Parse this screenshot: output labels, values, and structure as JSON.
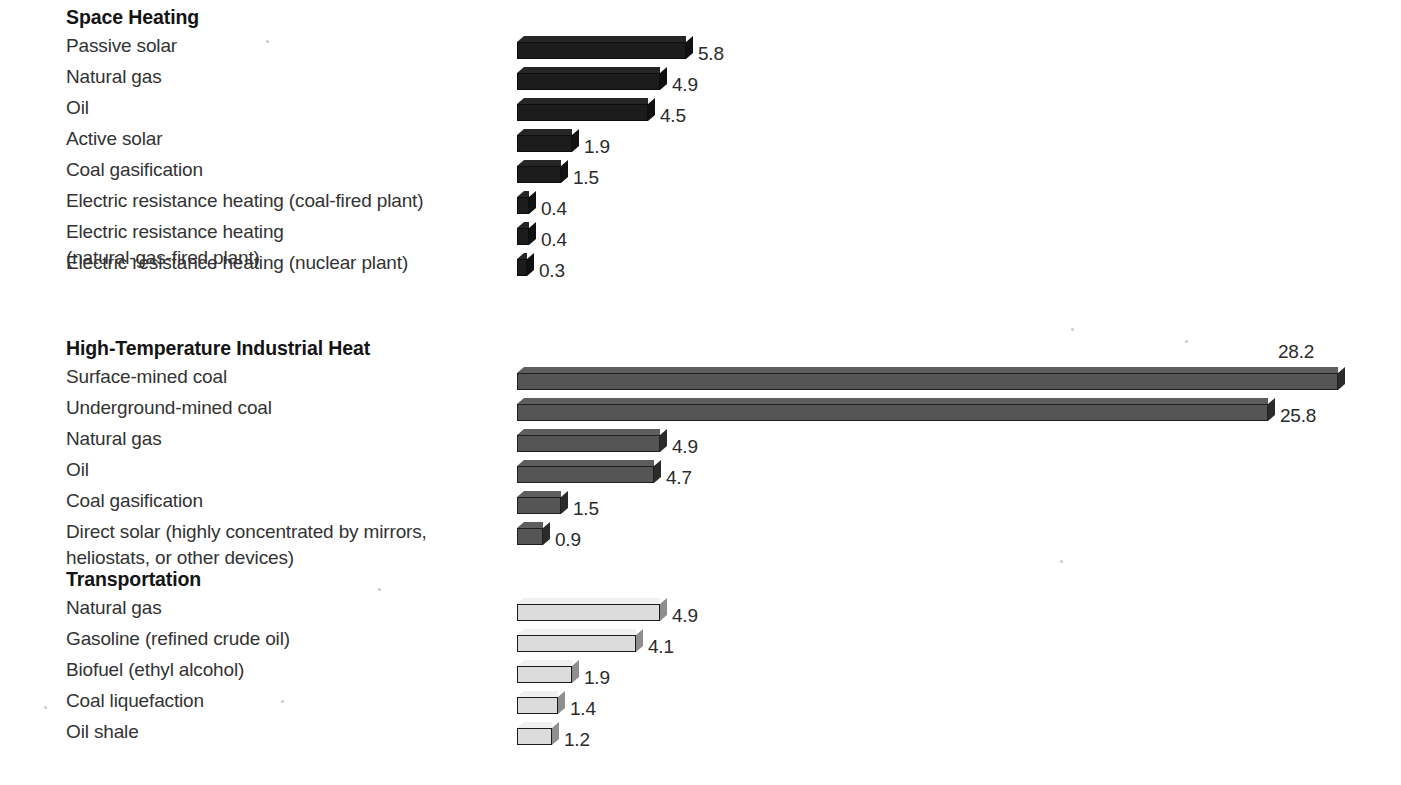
{
  "chart_data": {
    "type": "bar",
    "orientation": "horizontal",
    "title": "",
    "xlabel": "",
    "ylabel": "",
    "grid": false,
    "legend": "none",
    "value_axis_max": 30,
    "units": "net useful energy yield ratio",
    "groups": [
      {
        "name": "Space Heating",
        "style": "dark",
        "fill": "#1c1c1c",
        "categories": [
          "Passive solar",
          "Natural gas",
          "Oil",
          "Active solar",
          "Coal gasification",
          "Electric resistance heating (coal-fired plant)",
          "Electric resistance heating\n(natural-gas-fired plant)",
          "Electric resistance heating (nuclear plant)"
        ],
        "values": [
          5.8,
          4.9,
          4.5,
          1.9,
          1.5,
          0.4,
          0.4,
          0.3
        ],
        "labels": [
          "5.8",
          "4.9",
          "4.5",
          "1.9",
          "1.5",
          "0.4",
          "0.4",
          "0.3"
        ]
      },
      {
        "name": "High-Temperature Industrial Heat",
        "style": "mid",
        "fill": "#555555",
        "categories": [
          "Surface-mined coal",
          "Underground-mined coal",
          "Natural gas",
          "Oil",
          "Coal gasification",
          "Direct solar (highly concentrated by mirrors,\nheliostats, or other devices)"
        ],
        "values": [
          28.2,
          25.8,
          4.9,
          4.7,
          1.5,
          0.9
        ],
        "labels": [
          "28.2",
          "25.8",
          "4.9",
          "4.7",
          "1.5",
          "0.9"
        ]
      },
      {
        "name": "Transportation",
        "style": "light",
        "fill": "#dcdcdc",
        "categories": [
          "Natural gas",
          "Gasoline (refined crude oil)",
          "Biofuel (ethyl alcohol)",
          "Coal liquefaction",
          "Oil shale"
        ],
        "values": [
          4.9,
          4.1,
          1.9,
          1.4,
          1.2
        ],
        "labels": [
          "4.9",
          "4.1",
          "1.9",
          "1.4",
          "1.2"
        ]
      }
    ]
  },
  "layout": {
    "bar_origin_x": 517,
    "px_per_unit": 29.1,
    "sections": [
      {
        "title_top": 6,
        "first_row_top": 33,
        "row_height": 31,
        "row_extra": [
          0,
          0,
          0,
          0,
          0,
          0,
          0,
          14
        ],
        "label_tops": [
          0,
          0,
          0,
          0,
          0,
          0,
          0,
          0
        ]
      },
      {
        "title_top": 337,
        "first_row_top": 364,
        "row_height": 31,
        "row_extra": [
          0,
          0,
          0,
          0,
          0,
          0
        ]
      },
      {
        "title_top": 568,
        "first_row_top": 595,
        "row_height": 31,
        "row_extra": [
          0,
          0,
          0,
          0,
          0
        ]
      }
    ]
  }
}
